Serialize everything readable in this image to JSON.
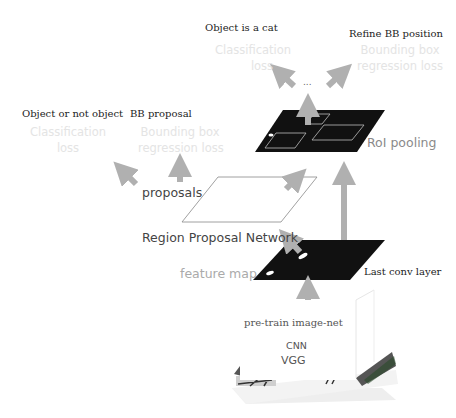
{
  "top_cut_text": "",
  "output_head": {
    "class_label": "Object is a cat",
    "bbox_label": "Refine BB position",
    "class_loss": [
      "Classification",
      "loss"
    ],
    "bbox_loss": [
      "Bounding box",
      "regression loss"
    ],
    "ellipsis": "..."
  },
  "rpn_head": {
    "class_label": "Object or not object",
    "bbox_label": "BB proposal",
    "class_loss": [
      "Classification",
      "loss"
    ],
    "bbox_loss": [
      "Bounding box",
      "regression loss"
    ]
  },
  "layers": {
    "roi_pooling": "RoI pooling",
    "proposals": "proposals",
    "rpn": "Region Proposal Network",
    "feature_map": "feature map",
    "last_conv": "Last conv layer",
    "pretrain": "pre-train image-net",
    "cnn": "CNN",
    "vgg": "VGG"
  },
  "colors": {
    "arrow": "#b0b0b0",
    "map_fill": "#111111",
    "faded_text": "#e4e4e4"
  }
}
